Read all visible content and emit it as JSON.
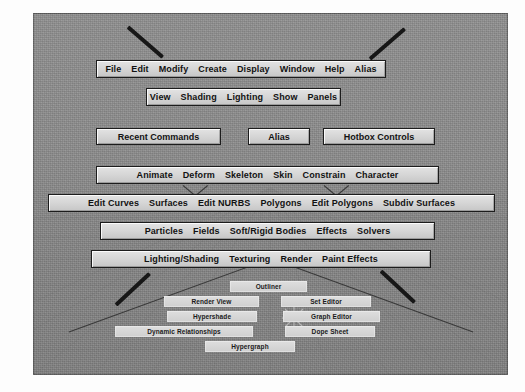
{
  "app": {
    "name": "Maya Hotbox",
    "viewport_bg": "#8b8b8b",
    "menu_fill": "#d4d4d4",
    "menu_border": "#1c1c1c",
    "text_color": "#121212"
  },
  "hotbox": {
    "rows": [
      {
        "name": "main-menu-row",
        "items": [
          "File",
          "Edit",
          "Modify",
          "Create",
          "Display",
          "Window",
          "Help",
          "Alias"
        ]
      },
      {
        "name": "panel-menu-row",
        "items": [
          "View",
          "Shading",
          "Lighting",
          "Show",
          "Panels"
        ]
      },
      {
        "name": "animation-menu-row",
        "items": [
          "Animate",
          "Deform",
          "Skeleton",
          "Skin",
          "Constrain",
          "Character"
        ]
      },
      {
        "name": "modeling-menu-row",
        "items": [
          "Edit Curves",
          "Surfaces",
          "Edit NURBS",
          "Polygons",
          "Edit Polygons",
          "Subdiv Surfaces"
        ]
      },
      {
        "name": "dynamics-menu-row",
        "items": [
          "Particles",
          "Fields",
          "Soft/Rigid Bodies",
          "Effects",
          "Solvers"
        ]
      },
      {
        "name": "rendering-menu-row",
        "items": [
          "Lighting/Shading",
          "Texturing",
          "Render",
          "Paint Effects"
        ]
      }
    ],
    "center_boxes": [
      {
        "name": "recent-commands-box",
        "label": "Recent Commands"
      },
      {
        "name": "alias-box",
        "label": "Alias"
      },
      {
        "name": "hotbox-controls-box",
        "label": "Hotbox Controls"
      }
    ],
    "editor_tiles": [
      {
        "name": "outliner-tile",
        "label": "Outliner"
      },
      {
        "name": "render-view-tile",
        "label": "Render View"
      },
      {
        "name": "set-editor-tile",
        "label": "Set Editor"
      },
      {
        "name": "hypershade-tile",
        "label": "Hypershade"
      },
      {
        "name": "graph-editor-tile",
        "label": "Graph Editor"
      },
      {
        "name": "dynamic-relationships-tile",
        "label": "Dynamic Relationships"
      },
      {
        "name": "dope-sheet-tile",
        "label": "Dope Sheet"
      },
      {
        "name": "hypergraph-tile",
        "label": "Hypergraph"
      }
    ]
  }
}
